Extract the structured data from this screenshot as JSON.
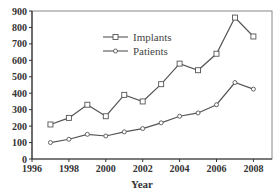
{
  "chart_data": {
    "type": "line",
    "title": "",
    "xlabel": "Year",
    "ylabel": "",
    "x": [
      1997,
      1998,
      1999,
      2000,
      2001,
      2002,
      2003,
      2004,
      2005,
      2006,
      2007,
      2008
    ],
    "series": [
      {
        "name": "Implants",
        "marker": "square",
        "values": [
          210,
          250,
          330,
          260,
          390,
          350,
          455,
          580,
          540,
          640,
          860,
          745
        ]
      },
      {
        "name": "Patients",
        "marker": "diamond",
        "values": [
          100,
          120,
          150,
          140,
          165,
          185,
          220,
          260,
          280,
          330,
          465,
          425
        ]
      }
    ],
    "xlim": [
      1996,
      2009
    ],
    "ylim": [
      0,
      900
    ],
    "xticks": [
      "1996",
      "1998",
      "2000",
      "2002",
      "2004",
      "2006",
      "2008"
    ],
    "yticks": [
      "0",
      "100",
      "200",
      "300",
      "400",
      "500",
      "600",
      "700",
      "800",
      "900"
    ],
    "grid": false,
    "legend_position": "upper-left-inside",
    "line_color": "#555555"
  }
}
